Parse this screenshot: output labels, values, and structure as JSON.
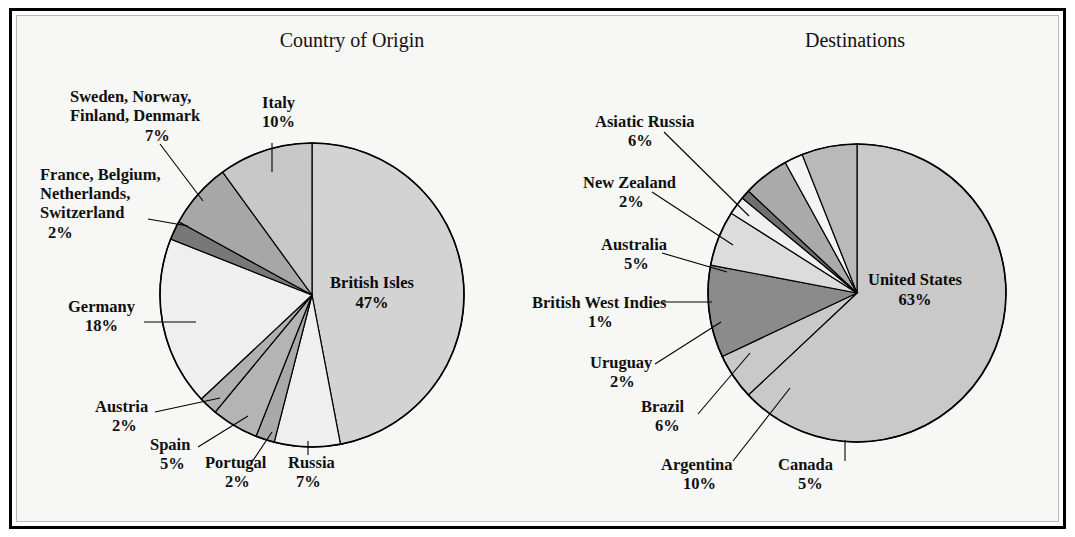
{
  "figure": {
    "background": "#f7f7f5",
    "frame_color": "#000000",
    "inner_rule_color": "#b9b9b9"
  },
  "chart_data": [
    {
      "type": "pie",
      "title": "Country of Origin",
      "id": "country-of-origin",
      "start_angle_deg": 0,
      "direction": "clockwise",
      "center": [
        312,
        295
      ],
      "radius": 152,
      "total_pct": 100,
      "slices": [
        {
          "label": "British Isles",
          "pct": 47,
          "pct_text": "47%",
          "color": "#d3d3d3",
          "label_placement": "inside",
          "label_xy": [
            372,
            288
          ],
          "pct_xy": [
            372,
            308
          ]
        },
        {
          "label": "Russia",
          "pct": 7,
          "pct_text": "7%",
          "color": "#efefef",
          "label_placement": "outside",
          "label_xy": [
            288,
            468
          ],
          "pct_xy": [
            296,
            487
          ],
          "anchor": "start",
          "leader": [
            [
              308,
              441
            ],
            [
              308,
              455
            ]
          ]
        },
        {
          "label": "Portugal",
          "pct": 2,
          "pct_text": "2%",
          "color": "#a9a9a9",
          "label_placement": "outside",
          "label_xy": [
            205,
            468
          ],
          "pct_xy": [
            225,
            487
          ],
          "anchor": "start",
          "leader": [
            [
              272,
              432
            ],
            [
              252,
              462
            ]
          ]
        },
        {
          "label": "Spain",
          "pct": 5,
          "pct_text": "5%",
          "color": "#b4b4b4",
          "label_placement": "outside",
          "label_xy": [
            150,
            450
          ],
          "pct_xy": [
            160,
            469
          ],
          "anchor": "start",
          "leader": [
            [
              248,
              416
            ],
            [
              198,
              447
            ]
          ]
        },
        {
          "label": "Austria",
          "pct": 2,
          "pct_text": "2%",
          "color": "#b0b0b0",
          "label_placement": "outside",
          "label_xy": [
            95,
            412
          ],
          "pct_xy": [
            112,
            431
          ],
          "anchor": "start",
          "leader": [
            [
              220,
              398
            ],
            [
              155,
              412
            ]
          ]
        },
        {
          "label": "Germany",
          "pct": 18,
          "pct_text": "18%",
          "color": "#efefef",
          "label_placement": "outside",
          "label_xy": [
            68,
            312
          ],
          "pct_xy": [
            85,
            331
          ],
          "anchor": "start",
          "leader": [
            [
              196,
              322
            ],
            [
              144,
              322
            ]
          ]
        },
        {
          "label": "France, Belgium, Netherlands, Switzerland",
          "label_lines": [
            "France, Belgium,",
            "Netherlands,",
            "Switzerland"
          ],
          "pct": 2,
          "pct_text": "2%",
          "color": "#787878",
          "label_placement": "outside",
          "label_xy": [
            40,
            180
          ],
          "pct_xy": [
            48,
            238
          ],
          "anchor": "start",
          "leader": [
            [
              188,
              226
            ],
            [
              148,
              219
            ]
          ]
        },
        {
          "label": "Sweden, Norway, Finland, Denmark",
          "label_lines": [
            "Sweden, Norway,",
            "Finland, Denmark"
          ],
          "pct": 7,
          "pct_text": "7%",
          "color": "#a7a7a7",
          "label_placement": "outside",
          "label_xy": [
            70,
            102
          ],
          "pct_xy": [
            145,
            141
          ],
          "anchor": "start",
          "leader": [
            [
              203,
              201
            ],
            [
              160,
              144
            ]
          ]
        },
        {
          "label": "Italy",
          "pct": 10,
          "pct_text": "10%",
          "color": "#c8c8c8",
          "label_placement": "outside",
          "label_xy": [
            262,
            108
          ],
          "pct_xy": [
            262,
            127
          ],
          "anchor": "start",
          "leader": [
            [
              272,
              172
            ],
            [
              272,
              143
            ]
          ]
        }
      ]
    },
    {
      "type": "pie",
      "title": "Destinations",
      "id": "destinations",
      "start_angle_deg": 0,
      "direction": "clockwise",
      "center": [
        857,
        293
      ],
      "radius": 149,
      "total_pct": 100,
      "slices": [
        {
          "label": "United States",
          "pct": 63,
          "pct_text": "63%",
          "color": "#c9c9c9",
          "label_placement": "inside",
          "label_xy": [
            915,
            285
          ],
          "pct_xy": [
            915,
            305
          ]
        },
        {
          "label": "Canada",
          "pct": 5,
          "pct_text": "5%",
          "color": "#c9c9c9",
          "label_placement": "outside",
          "label_xy": [
            778,
            470
          ],
          "pct_xy": [
            798,
            489
          ],
          "anchor": "start",
          "leader": [
            [
              845,
              440
            ],
            [
              845,
              461
            ]
          ]
        },
        {
          "label": "Argentina",
          "pct": 10,
          "pct_text": "10%",
          "color": "#8b8b8b",
          "label_placement": "outside",
          "label_xy": [
            661,
            470
          ],
          "pct_xy": [
            683,
            489
          ],
          "anchor": "start",
          "leader": [
            [
              790,
              388
            ],
            [
              733,
              461
            ]
          ]
        },
        {
          "label": "Brazil",
          "pct": 6,
          "pct_text": "6%",
          "color": "#dcdcdc",
          "label_placement": "outside",
          "label_xy": [
            641,
            412
          ],
          "pct_xy": [
            655,
            431
          ],
          "anchor": "start",
          "leader": [
            [
              750,
              353
            ],
            [
              698,
              414
            ]
          ]
        },
        {
          "label": "Uruguay",
          "pct": 2,
          "pct_text": "2%",
          "color": "#f0f0f0",
          "label_placement": "outside",
          "label_xy": [
            590,
            368
          ],
          "pct_xy": [
            610,
            387
          ],
          "anchor": "start",
          "leader": [
            [
              721,
              322
            ],
            [
              655,
              364
            ]
          ]
        },
        {
          "label": "British West Indies",
          "pct": 1,
          "pct_text": "1%",
          "color": "#6f6f6f",
          "label_placement": "outside",
          "label_xy": [
            532,
            308
          ],
          "pct_xy": [
            588,
            327
          ],
          "anchor": "start",
          "leader": [
            [
              712,
              302
            ],
            [
              662,
              302
            ]
          ]
        },
        {
          "label": "Australia",
          "pct": 5,
          "pct_text": "5%",
          "color": "#aaaaaa",
          "label_placement": "outside",
          "label_xy": [
            601,
            250
          ],
          "pct_xy": [
            624,
            269
          ],
          "anchor": "start",
          "leader": [
            [
              727,
              272
            ],
            [
              662,
              253
            ]
          ]
        },
        {
          "label": "New Zealand",
          "pct": 2,
          "pct_text": "2%",
          "color": "#f4f4f4",
          "label_placement": "outside",
          "label_xy": [
            583,
            188
          ],
          "pct_xy": [
            619,
            207
          ],
          "anchor": "start",
          "leader": [
            [
              733,
              245
            ],
            [
              652,
              192
            ]
          ]
        },
        {
          "label": "Asiatic Russia",
          "pct": 6,
          "pct_text": "6%",
          "color": "#b9b9b9",
          "label_placement": "outside",
          "label_xy": [
            595,
            127
          ],
          "pct_xy": [
            628,
            146
          ],
          "anchor": "start",
          "leader": [
            [
              749,
              216
            ],
            [
              664,
              132
            ]
          ]
        }
      ]
    }
  ]
}
